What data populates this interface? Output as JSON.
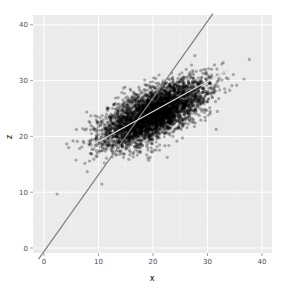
{
  "chart_data": {
    "type": "scatter",
    "title": "",
    "xlabel": "x",
    "ylabel": "z",
    "xlim": [
      -2,
      42
    ],
    "ylim": [
      -2,
      42
    ],
    "x_ticks": [
      0,
      10,
      20,
      30,
      40
    ],
    "y_ticks": [
      0,
      10,
      20,
      30,
      40
    ],
    "grid": true,
    "legend": "none",
    "background": "#ebebeb",
    "series": [
      {
        "name": "points",
        "kind": "scatter",
        "color": "#000000",
        "alpha": 0.3,
        "distribution": {
          "center": [
            20,
            25
          ],
          "x_range": [
            6,
            36
          ],
          "y_range": [
            15,
            36
          ],
          "correlation": "strong positive",
          "n_approx": 10000
        }
      },
      {
        "name": "steep-line",
        "kind": "line",
        "color": "#7f7f7f",
        "points": [
          [
            -1,
            -2
          ],
          [
            31,
            42
          ]
        ]
      },
      {
        "name": "shallow-line",
        "kind": "line",
        "color": "#d9d9d9",
        "points": [
          [
            8,
            18
          ],
          [
            34,
            32
          ]
        ]
      }
    ]
  },
  "axes": {
    "x_title": "x",
    "y_title": "z",
    "x_tick_labels": [
      "0",
      "10",
      "20",
      "30",
      "40"
    ],
    "y_tick_labels": [
      "0",
      "10",
      "20",
      "30",
      "40"
    ]
  }
}
